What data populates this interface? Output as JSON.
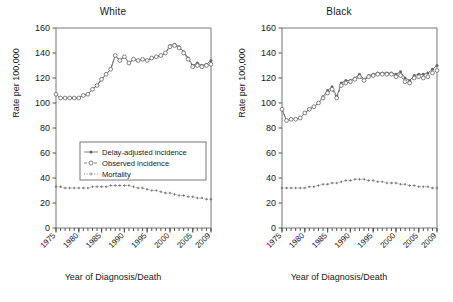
{
  "figure": {
    "xlabel": "Year of Diagnosis/Death",
    "ylabel": "Rate per 100,000"
  },
  "legend": {
    "items": [
      {
        "label": "Delay-adjusted incidence",
        "marker": "filled-dot",
        "line": "solid"
      },
      {
        "label": "Observed incidence",
        "marker": "open-circle",
        "line": "dashed"
      },
      {
        "label": "Mortality",
        "marker": "cross",
        "line": "dotted"
      }
    ]
  },
  "colors": {
    "axis": "#555555",
    "series": "#666666",
    "text": "#1a1a1a",
    "frame": "#777777"
  },
  "chart_data": [
    {
      "type": "line",
      "title": "White",
      "xlabel": "Year of Diagnosis/Death",
      "ylabel": "Rate per 100,000",
      "xlim": [
        1975,
        2009
      ],
      "ylim": [
        0,
        160
      ],
      "yticks": [
        0,
        20,
        40,
        60,
        80,
        100,
        120,
        140,
        160
      ],
      "xticks": [
        1975,
        1980,
        1985,
        1990,
        1995,
        2000,
        2005,
        2009
      ],
      "xticklabels": [
        "1975",
        "1980",
        "1985",
        "1990",
        "1995",
        "2000",
        "2005",
        "2009"
      ],
      "grid": false,
      "legend_position": "center-left",
      "x": [
        1975,
        1976,
        1977,
        1978,
        1979,
        1980,
        1981,
        1982,
        1983,
        1984,
        1985,
        1986,
        1987,
        1988,
        1989,
        1990,
        1991,
        1992,
        1993,
        1994,
        1995,
        1996,
        1997,
        1998,
        1999,
        2000,
        2001,
        2002,
        2003,
        2004,
        2005,
        2006,
        2007,
        2008,
        2009
      ],
      "series": [
        {
          "name": "Delay-adjusted incidence",
          "marker": "filled-dot",
          "line": "solid",
          "values": [
            107,
            104,
            104,
            104,
            104,
            104,
            106,
            107,
            111,
            114,
            119,
            123,
            127,
            138,
            134,
            137,
            132,
            135,
            134,
            135,
            134,
            136,
            137,
            138,
            140,
            146,
            147,
            145,
            141,
            136,
            130,
            132,
            130,
            131,
            134
          ]
        },
        {
          "name": "Observed incidence",
          "marker": "open-circle",
          "line": "dashed",
          "values": [
            107,
            104,
            104,
            104,
            104,
            104,
            106,
            107,
            111,
            114,
            119,
            123,
            127,
            138,
            134,
            137,
            132,
            135,
            134,
            135,
            134,
            136,
            137,
            138,
            140,
            145,
            146,
            144,
            140,
            135,
            129,
            130,
            129,
            130,
            131
          ]
        },
        {
          "name": "Mortality",
          "marker": "cross",
          "line": "dotted",
          "values": [
            33,
            33,
            32,
            32,
            32,
            32,
            32,
            32,
            33,
            33,
            33,
            33,
            34,
            34,
            34,
            34,
            34,
            33,
            32,
            32,
            31,
            30,
            30,
            29,
            28,
            28,
            27,
            26,
            26,
            25,
            25,
            24,
            24,
            23,
            23
          ]
        }
      ]
    },
    {
      "type": "line",
      "title": "Black",
      "xlabel": "Year of Diagnosis/Death",
      "ylabel": "Rate per 100,000",
      "xlim": [
        1975,
        2009
      ],
      "ylim": [
        0,
        160
      ],
      "yticks": [
        0,
        20,
        40,
        60,
        80,
        100,
        120,
        140,
        160
      ],
      "xticks": [
        1975,
        1980,
        1985,
        1990,
        1995,
        2000,
        2005,
        2009
      ],
      "xticklabels": [
        "1975",
        "1980",
        "1985",
        "1990",
        "1995",
        "2000",
        "2005",
        "2009"
      ],
      "grid": false,
      "legend_position": "none",
      "x": [
        1975,
        1976,
        1977,
        1978,
        1979,
        1980,
        1981,
        1982,
        1983,
        1984,
        1985,
        1986,
        1987,
        1988,
        1989,
        1990,
        1991,
        1992,
        1993,
        1994,
        1995,
        1996,
        1997,
        1998,
        1999,
        2000,
        2001,
        2002,
        2003,
        2004,
        2005,
        2006,
        2007,
        2008,
        2009
      ],
      "series": [
        {
          "name": "Delay-adjusted incidence",
          "marker": "filled-dot",
          "line": "solid",
          "values": [
            95,
            86,
            87,
            87,
            88,
            92,
            95,
            97,
            100,
            105,
            110,
            113,
            105,
            116,
            118,
            118,
            120,
            123,
            119,
            122,
            123,
            124,
            124,
            124,
            124,
            123,
            125,
            120,
            118,
            122,
            123,
            123,
            124,
            127,
            130
          ]
        },
        {
          "name": "Observed incidence",
          "marker": "open-circle",
          "line": "dashed",
          "values": [
            95,
            86,
            87,
            87,
            88,
            92,
            95,
            97,
            100,
            104,
            108,
            111,
            104,
            114,
            116,
            117,
            119,
            121,
            118,
            121,
            122,
            123,
            123,
            123,
            123,
            121,
            122,
            117,
            116,
            120,
            121,
            120,
            121,
            124,
            126
          ]
        },
        {
          "name": "Mortality",
          "marker": "cross",
          "line": "dotted",
          "values": [
            32,
            32,
            32,
            32,
            32,
            32,
            33,
            33,
            34,
            35,
            35,
            36,
            36,
            37,
            38,
            38,
            39,
            39,
            39,
            38,
            38,
            37,
            37,
            36,
            36,
            36,
            35,
            35,
            34,
            34,
            33,
            33,
            33,
            32,
            32
          ]
        }
      ]
    }
  ]
}
